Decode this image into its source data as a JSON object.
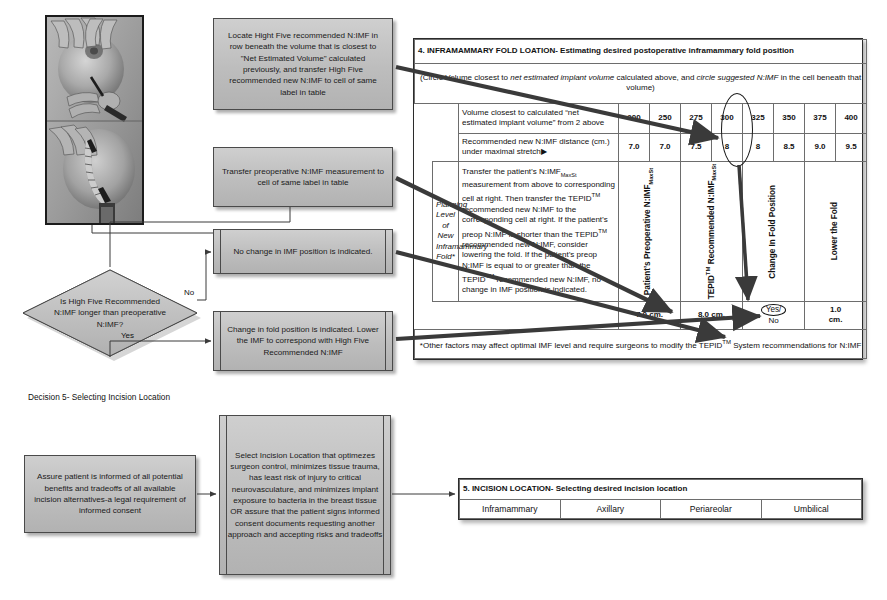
{
  "decision5_label": "Decision 5- Selecting Incision Location",
  "photo": {
    "alt": "clinical-photograph-breast-imf-measurement"
  },
  "flow": {
    "box_locate": "Locate Hight Five recommended N:IMF in row beneath the volume that is closest to \"Net Estimated Volume\" calculated previously, and transfer High Five recommended new N:IMF to cell of same label in table",
    "box_transfer": "Transfer preoperative N:IMF measurement to cell of same label in table",
    "box_nochange": "No change in IMF position is indicated.",
    "box_change": "Change in fold position is indicated. Lower the IMF to correspond with High Five Recommended N:IMF",
    "decision_question": "Is High Five Recommended N:IMF longer than preoperative N:IMF?",
    "edge_no": "No",
    "edge_yes": "Yes",
    "box_assure": "Assure patient is informed of all potential benefits and tradeoffs of all available incision alternatives-a legal requirement of informed consent",
    "box_select": "Select Incision Location that optimezes surgeon control, minimizes tissue trauma, has least risk of injury to critical neurovasculature, and minimizes implant exposure to bacteria in the breast tissue OR assure that the patient signs informed consent documents requesting another approach and accepting risks and tradeoffs"
  },
  "table4": {
    "header": "4. INFRAMAMMARY FOLD LOATION- Estimating desired postoperative inframammary fold position",
    "subheader_parts": {
      "p1": "(Circle Volume closest to ",
      "p2": "net estimated implant volume",
      "p3": " calculated above, and ",
      "p4": "circle suggested N:IMF",
      "p5": " in the cell beneath that volume)"
    },
    "row_volume_label": "Volume closest to calculated “net estimated implant volume” from 2 above",
    "row_volume_values": [
      "200",
      "250",
      "275",
      "300",
      "325",
      "350",
      "375",
      "400"
    ],
    "row_nimf_label": "Recommended new N:IMF distance (cm.) under maximal stretch▶",
    "row_nimf_values": [
      "7.0",
      "7.0",
      "7.5",
      "8",
      "8",
      "8.5",
      "9.0",
      "9.5"
    ],
    "circled_volume": "300",
    "circled_nimf": "8",
    "planning_label": "Planning Level of New Inframammary Fold*",
    "body_text": "Transfer the patient’s N:IMF MaxSt measurement from above to corresponding cell at right. Then transfer the TEPID™ recommended new N:IMF to the corresponding cell at right. If the patient’s preop N:IMF is shorter than the TEPID™ recommended new N:IMF, consider lowering the fold. If the patient’s preop N:IMF is equal to or greater than the TEPID™ recommended new N:IMF, no change in IMF position is indicated.",
    "col_headers": [
      "Patient’s Preoperative N:IMF MaxSt",
      "TEPID™ Recommended N:IMF MaxSt",
      "Change In Fold Position",
      "Lower the Fold"
    ],
    "result_values": [
      "7.0 cm.",
      "8.0 cm.",
      "Yes/ No",
      "1.0 cm."
    ],
    "result_yes": "Yes/",
    "result_no": "No",
    "footnote": "*Other factors may affect optimal IMF level and require surgeons to modify the TEPID™ System recommendations for N:IMF"
  },
  "table5": {
    "header": "5. INCISION LOCATION- Selecting desired incision location",
    "options": [
      "Inframammary",
      "Axillary",
      "Periareolar",
      "Umbilical"
    ]
  },
  "colors": {
    "box_fill": "#c2c2c2",
    "box_border": "#4a4a4a",
    "connector": "#3b3b3b",
    "table_border": "#2b2b2b",
    "arrow": "#3a3a3a"
  }
}
